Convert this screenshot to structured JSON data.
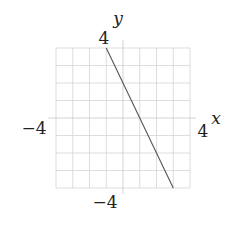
{
  "chart_data": {
    "type": "line",
    "title": "",
    "xlabel": "x",
    "ylabel": "y",
    "xlim": [
      -4,
      4
    ],
    "ylim": [
      -4,
      4
    ],
    "grid": true,
    "grid_step": 1,
    "tick_labels": {
      "x_min": "−4",
      "x_max": "4",
      "y_min": "−4",
      "y_max": "4"
    },
    "series": [
      {
        "name": "line",
        "equation": "y = -2x + 2",
        "x": [
          -1,
          3
        ],
        "y": [
          4,
          -4
        ]
      }
    ]
  },
  "colors": {
    "grid": "#d4d4d4",
    "axis": "#c8c8c8",
    "line": "#555555"
  }
}
